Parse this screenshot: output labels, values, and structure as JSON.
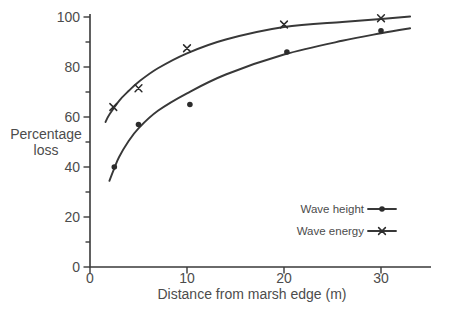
{
  "chart_data": {
    "type": "scatter-line",
    "title": "",
    "xlabel": "Distance from marsh edge (m)",
    "ylabel": "Percentage loss",
    "ylabel_lines": [
      "Percentage",
      "loss"
    ],
    "xlim": [
      0,
      35
    ],
    "ylim": [
      0,
      100
    ],
    "x_ticks": [
      0,
      10,
      20,
      30
    ],
    "y_ticks_major": [
      0,
      20,
      40,
      60,
      80,
      100
    ],
    "y_ticks_minor": [
      10,
      30,
      50,
      70,
      90
    ],
    "grid": false,
    "legend_position": "inside-lower-right",
    "colors": {
      "ink": "#3a3a3a",
      "text": "#4c4c4c",
      "background": "#ffffff"
    },
    "series": [
      {
        "name": "Wave height",
        "marker": "circle",
        "points": [
          [
            2.5,
            40
          ],
          [
            5,
            57
          ],
          [
            10.3,
            65
          ],
          [
            20.3,
            86
          ],
          [
            30,
            94.5
          ]
        ],
        "fitted_curve": [
          [
            2,
            34.5
          ],
          [
            2.5,
            39.5
          ],
          [
            3,
            44
          ],
          [
            4,
            50.5
          ],
          [
            5,
            55.5
          ],
          [
            7,
            62.5
          ],
          [
            10,
            69.5
          ],
          [
            14,
            77
          ],
          [
            20,
            85
          ],
          [
            26,
            90.5
          ],
          [
            30,
            93.5
          ],
          [
            33,
            95.5
          ]
        ]
      },
      {
        "name": "Wave energy",
        "marker": "x",
        "points": [
          [
            2.4,
            64
          ],
          [
            5,
            71.5
          ],
          [
            10,
            87.5
          ],
          [
            20,
            97
          ],
          [
            30,
            99.5
          ]
        ],
        "fitted_curve": [
          [
            1.6,
            58
          ],
          [
            2,
            61
          ],
          [
            3,
            66.5
          ],
          [
            4,
            70.5
          ],
          [
            5,
            74
          ],
          [
            7,
            79.5
          ],
          [
            10,
            85.5
          ],
          [
            14,
            91
          ],
          [
            20,
            96
          ],
          [
            26,
            98
          ],
          [
            30,
            99.2
          ],
          [
            33,
            100.2
          ]
        ]
      }
    ]
  }
}
